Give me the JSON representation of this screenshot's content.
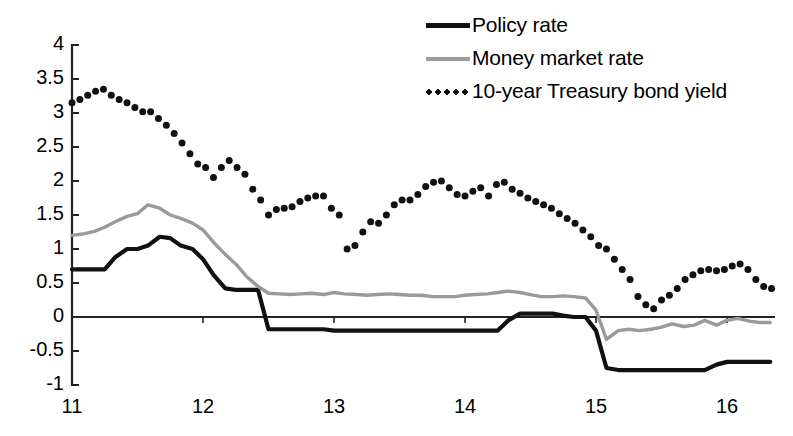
{
  "chart_data": {
    "type": "line",
    "title": "",
    "subtitle": "",
    "xlabel": "",
    "ylabel": "",
    "xlim": [
      11.0,
      16.35
    ],
    "ylim": [
      -1,
      4
    ],
    "grid": false,
    "zero_line": true,
    "legend_position": "top-right",
    "y_ticks": [
      "4",
      "3.5",
      "3",
      "2.5",
      "2",
      "1.5",
      "1",
      "0.5",
      "0",
      "-0.5",
      "-1"
    ],
    "y_tick_values": [
      4,
      3.5,
      3,
      2.5,
      2,
      1.5,
      1,
      0.5,
      0,
      -0.5,
      -1
    ],
    "x_ticks": [
      "11",
      "12",
      "13",
      "14",
      "15",
      "16"
    ],
    "x_tick_values": [
      11,
      12,
      13,
      14,
      15,
      16
    ],
    "colors": {
      "policy_rate": "#111111",
      "money_market_rate": "#9a9a9a",
      "treasury_yield": "#111111",
      "axis": "#222222",
      "background": "#ffffff"
    },
    "series": [
      {
        "name": "Policy rate",
        "style": "solid-thick",
        "color": "#111111",
        "x": [
          11.0,
          11.08,
          11.17,
          11.25,
          11.33,
          11.42,
          11.5,
          11.58,
          11.67,
          11.75,
          11.83,
          11.92,
          12.0,
          12.08,
          12.17,
          12.25,
          12.33,
          12.42,
          12.5,
          12.58,
          12.67,
          12.75,
          12.83,
          12.92,
          13.0,
          13.08,
          13.17,
          13.25,
          13.33,
          13.42,
          13.5,
          13.58,
          13.67,
          13.75,
          13.83,
          13.92,
          14.0,
          14.08,
          14.17,
          14.25,
          14.33,
          14.42,
          14.5,
          14.58,
          14.67,
          14.75,
          14.83,
          14.92,
          15.0,
          15.08,
          15.17,
          15.25,
          15.33,
          15.42,
          15.5,
          15.58,
          15.67,
          15.75,
          15.83,
          15.92,
          16.0,
          16.08,
          16.17,
          16.25,
          16.33
        ],
        "y": [
          0.7,
          0.7,
          0.7,
          0.7,
          0.88,
          1.0,
          1.0,
          1.05,
          1.18,
          1.16,
          1.05,
          1.0,
          0.85,
          0.62,
          0.42,
          0.4,
          0.4,
          0.4,
          -0.18,
          -0.18,
          -0.18,
          -0.18,
          -0.18,
          -0.18,
          -0.2,
          -0.2,
          -0.2,
          -0.2,
          -0.2,
          -0.2,
          -0.2,
          -0.2,
          -0.2,
          -0.2,
          -0.2,
          -0.2,
          -0.2,
          -0.2,
          -0.2,
          -0.2,
          -0.05,
          0.05,
          0.05,
          0.05,
          0.05,
          0.02,
          0.0,
          0.0,
          -0.2,
          -0.75,
          -0.78,
          -0.78,
          -0.78,
          -0.78,
          -0.78,
          -0.78,
          -0.78,
          -0.78,
          -0.78,
          -0.7,
          -0.66,
          -0.66,
          -0.66,
          -0.66,
          -0.66
        ]
      },
      {
        "name": "Money market rate",
        "style": "solid-gray",
        "color": "#9a9a9a",
        "x": [
          11.0,
          11.08,
          11.17,
          11.25,
          11.33,
          11.42,
          11.5,
          11.58,
          11.67,
          11.75,
          11.83,
          11.92,
          12.0,
          12.08,
          12.17,
          12.25,
          12.33,
          12.42,
          12.5,
          12.58,
          12.67,
          12.75,
          12.83,
          12.92,
          13.0,
          13.08,
          13.17,
          13.25,
          13.33,
          13.42,
          13.5,
          13.58,
          13.67,
          13.75,
          13.83,
          13.92,
          14.0,
          14.08,
          14.17,
          14.25,
          14.33,
          14.42,
          14.5,
          14.58,
          14.67,
          14.75,
          14.83,
          14.92,
          15.0,
          15.08,
          15.17,
          15.25,
          15.33,
          15.42,
          15.5,
          15.58,
          15.67,
          15.75,
          15.83,
          15.92,
          16.0,
          16.08,
          16.17,
          16.25,
          16.33
        ],
        "y": [
          1.2,
          1.22,
          1.26,
          1.32,
          1.4,
          1.48,
          1.52,
          1.65,
          1.6,
          1.5,
          1.45,
          1.38,
          1.28,
          1.1,
          0.92,
          0.78,
          0.6,
          0.45,
          0.35,
          0.34,
          0.33,
          0.34,
          0.35,
          0.33,
          0.36,
          0.34,
          0.33,
          0.32,
          0.33,
          0.34,
          0.33,
          0.32,
          0.32,
          0.3,
          0.3,
          0.3,
          0.32,
          0.33,
          0.34,
          0.36,
          0.38,
          0.36,
          0.33,
          0.3,
          0.3,
          0.31,
          0.3,
          0.28,
          0.1,
          -0.33,
          -0.2,
          -0.18,
          -0.2,
          -0.18,
          -0.15,
          -0.1,
          -0.14,
          -0.12,
          -0.05,
          -0.12,
          -0.05,
          -0.02,
          -0.06,
          -0.08,
          -0.08
        ]
      },
      {
        "name": "10-year Treasury bond yield",
        "style": "dotted",
        "color": "#111111",
        "x": [
          11.0,
          11.06,
          11.12,
          11.18,
          11.24,
          11.3,
          11.36,
          11.42,
          11.48,
          11.54,
          11.6,
          11.66,
          11.72,
          11.78,
          11.84,
          11.9,
          11.96,
          12.02,
          12.08,
          12.14,
          12.2,
          12.26,
          12.32,
          12.38,
          12.44,
          12.5,
          12.56,
          12.62,
          12.68,
          12.74,
          12.8,
          12.86,
          12.92,
          12.98,
          13.04,
          13.1,
          13.16,
          13.22,
          13.28,
          13.34,
          13.4,
          13.46,
          13.52,
          13.58,
          13.64,
          13.7,
          13.76,
          13.82,
          13.88,
          13.94,
          14.0,
          14.06,
          14.12,
          14.18,
          14.24,
          14.3,
          14.36,
          14.42,
          14.48,
          14.54,
          14.6,
          14.66,
          14.72,
          14.78,
          14.84,
          14.9,
          14.96,
          15.02,
          15.08,
          15.14,
          15.2,
          15.26,
          15.32,
          15.38,
          15.44,
          15.5,
          15.56,
          15.62,
          15.68,
          15.74,
          15.8,
          15.86,
          15.92,
          15.98,
          16.04,
          16.1,
          16.16,
          16.22,
          16.28,
          16.34
        ],
        "y": [
          3.15,
          3.2,
          3.26,
          3.32,
          3.35,
          3.26,
          3.2,
          3.15,
          3.08,
          3.02,
          3.02,
          2.92,
          2.82,
          2.7,
          2.56,
          2.4,
          2.25,
          2.2,
          2.05,
          2.2,
          2.3,
          2.2,
          2.1,
          1.88,
          1.72,
          1.5,
          1.58,
          1.6,
          1.62,
          1.7,
          1.75,
          1.78,
          1.78,
          1.6,
          1.5,
          1.0,
          1.05,
          1.25,
          1.4,
          1.38,
          1.5,
          1.65,
          1.72,
          1.72,
          1.8,
          1.92,
          1.98,
          2.0,
          1.9,
          1.8,
          1.78,
          1.85,
          1.9,
          1.78,
          1.95,
          1.98,
          1.88,
          1.82,
          1.75,
          1.7,
          1.65,
          1.6,
          1.52,
          1.45,
          1.38,
          1.28,
          1.18,
          1.05,
          1.0,
          0.85,
          0.7,
          0.55,
          0.3,
          0.18,
          0.12,
          0.25,
          0.32,
          0.42,
          0.55,
          0.62,
          0.68,
          0.7,
          0.68,
          0.7,
          0.75,
          0.78,
          0.7,
          0.55,
          0.45,
          0.42
        ]
      }
    ]
  },
  "legend": {
    "items": [
      {
        "label": "Policy rate",
        "swatch": "solid-thick-line-swatch"
      },
      {
        "label": "Money market rate",
        "swatch": "solid-gray-line-swatch"
      },
      {
        "label": "10-year Treasury bond yield",
        "swatch": "dotted-line-swatch"
      }
    ]
  }
}
